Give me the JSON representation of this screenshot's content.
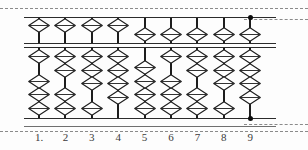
{
  "figure": {
    "kind": "abacus-diagram",
    "columns_count": 9,
    "beads_per_rod_lower": 4,
    "beads_per_rod_upper": 1,
    "colors": {
      "ink": "#1d1d1d",
      "frame": "#2b2b2b",
      "bead_fill": "#ffffff",
      "bead_stroke": "#1d1d1d",
      "guide": "#8a8a8a",
      "label": "#3a3a3a",
      "background": "#fdfdfd"
    }
  },
  "guides": {
    "top_line": "dashed-guide-top",
    "bottom_line": "dashed-guide-bottom",
    "top_right_line": "dashed-guide-top-right",
    "bottom_right_line": "dashed-guide-bottom-right"
  },
  "frame": {
    "top_rail": "top-rail",
    "reckoning_beam_upper": "beam-upper-line",
    "reckoning_beam_lower": "beam-lower-line",
    "bottom_rail": "bottom-rail",
    "base_rail": "base-rail"
  },
  "markers": {
    "top_dot_column": 9,
    "bottom_dot_column": 9,
    "top_dot_name": "unit-marker-dot-top",
    "bottom_dot_name": "unit-marker-dot-bottom"
  },
  "labels": [
    {
      "text": "1.",
      "column": 1
    },
    {
      "text": "2",
      "column": 2
    },
    {
      "text": "3",
      "column": 3
    },
    {
      "text": "4",
      "column": 4
    },
    {
      "text": "5",
      "column": 5
    },
    {
      "text": "6",
      "column": 6
    },
    {
      "text": "7",
      "column": 7
    },
    {
      "text": "8",
      "column": 8
    },
    {
      "text": "9",
      "column": 9
    }
  ],
  "chart_data": {
    "type": "table",
    "categories": [
      "1",
      "2",
      "3",
      "4",
      "5",
      "6",
      "7",
      "8",
      "9"
    ],
    "series": [
      {
        "name": "upper bead engaged (value 5)",
        "values": [
          0,
          0,
          0,
          0,
          1,
          1,
          1,
          1,
          1
        ]
      },
      {
        "name": "lower beads engaged (raised to beam)",
        "values": [
          0,
          0,
          0,
          0,
          0,
          1,
          2,
          3,
          4
        ]
      },
      {
        "name": "lower beads resting at bottom rail",
        "values": [
          3,
          2,
          1,
          0,
          4,
          3,
          2,
          1,
          0
        ]
      },
      {
        "name": "column digit value",
        "values": [
          3,
          2,
          1,
          0,
          9,
          8,
          7,
          6,
          5
        ]
      }
    ],
    "xlabel": "column",
    "ylabel": "bead count",
    "grid": false,
    "legend": "none"
  },
  "rods": [
    {
      "column": 1,
      "upper_bead_position": "up",
      "lower_top_group": 1,
      "lower_bottom_group": 3,
      "digit": 3
    },
    {
      "column": 2,
      "upper_bead_position": "up",
      "lower_top_group": 2,
      "lower_bottom_group": 2,
      "digit": 2
    },
    {
      "column": 3,
      "upper_bead_position": "up",
      "lower_top_group": 3,
      "lower_bottom_group": 1,
      "digit": 1
    },
    {
      "column": 4,
      "upper_bead_position": "up",
      "lower_top_group": 4,
      "lower_bottom_group": 0,
      "digit": 0
    },
    {
      "column": 5,
      "upper_bead_position": "down",
      "lower_top_group": 0,
      "lower_bottom_group": 4,
      "digit": 9
    },
    {
      "column": 6,
      "upper_bead_position": "down",
      "lower_top_group": 1,
      "lower_bottom_group": 3,
      "digit": 8
    },
    {
      "column": 7,
      "upper_bead_position": "down",
      "lower_top_group": 2,
      "lower_bottom_group": 2,
      "digit": 7
    },
    {
      "column": 8,
      "upper_bead_position": "down",
      "lower_top_group": 3,
      "lower_bottom_group": 1,
      "digit": 6
    },
    {
      "column": 9,
      "upper_bead_position": "down",
      "lower_top_group": 4,
      "lower_bottom_group": 0,
      "digit": 5
    }
  ]
}
